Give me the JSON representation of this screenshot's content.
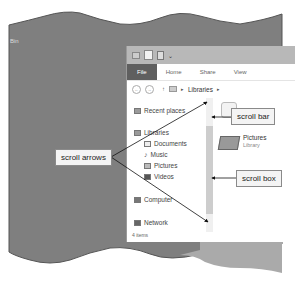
{
  "desktop": {
    "label": "Bin"
  },
  "window": {
    "quick_access": {
      "chevron": "⌄"
    },
    "ribbon_tabs": [
      {
        "label": "File",
        "active": true
      },
      {
        "label": "Home"
      },
      {
        "label": "Share"
      },
      {
        "label": "View"
      }
    ],
    "address_bar": {
      "back": "←",
      "forward": "→",
      "up": "↑",
      "path": "Libraries",
      "separator": "▸"
    },
    "navigation": [
      {
        "label": "Recent places",
        "icon": "recent-places-icon",
        "indent": false
      },
      {
        "label": "Libraries",
        "icon": "libraries-icon",
        "indent": false
      },
      {
        "label": "Documents",
        "icon": "documents-icon",
        "indent": true
      },
      {
        "label": "Music",
        "icon": "music-icon",
        "indent": true
      },
      {
        "label": "Pictures",
        "icon": "pictures-icon",
        "indent": true
      },
      {
        "label": "Videos",
        "icon": "videos-icon",
        "indent": true
      },
      {
        "label": "Computer",
        "icon": "computer-icon",
        "indent": false
      },
      {
        "label": "Network",
        "icon": "network-icon",
        "indent": false
      }
    ],
    "content_items": [
      {
        "name": "Documents",
        "type": "Library"
      },
      {
        "name": "Pictures",
        "type": "Library"
      }
    ],
    "status_bar": {
      "text": "4 items"
    }
  },
  "callouts": {
    "scroll_arrows": "scroll arrows",
    "scroll_bar": "scroll bar",
    "scroll_box": "scroll box"
  },
  "colors": {
    "desktop_gray": "#7d7d7d",
    "file_tab": "#5f5f5f",
    "titlebar": "#b8b8b8",
    "scroll_box": "#cdcdcd"
  }
}
